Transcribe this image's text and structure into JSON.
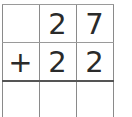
{
  "problem": {
    "operation": "addition",
    "operator": "+",
    "rows": [
      [
        "",
        "2",
        "7"
      ],
      [
        "+",
        "2",
        "2"
      ],
      [
        "",
        "",
        ""
      ]
    ],
    "addend_1": "27",
    "addend_2": "22",
    "answer": ""
  },
  "colors": {
    "grid_line": "#8a8a8a",
    "answer_line": "#555555",
    "digit": "#2a2a2a",
    "background": "#ffffff"
  }
}
